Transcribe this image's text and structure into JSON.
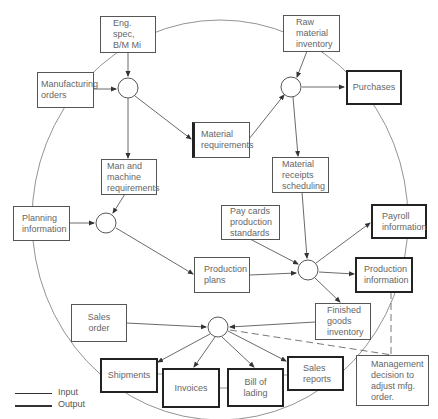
{
  "diagram": {
    "nodes": {
      "eng_spec": "Eng. spec,\nB/M Mi",
      "raw_material": "Raw\nmaterial\ninventory",
      "manufacturing_orders": "Manufacturing\norders",
      "purchases": "Purchases",
      "material_requirements": "Material\nrequirements",
      "man_machine": "Man and\nmachine\nrequirements",
      "material_receipts": "Material\nreceipts\nscheduling",
      "planning_information": "Planning\ninformation",
      "pay_cards": "Pay cards\nproduction\nstandards",
      "payroll_information": "Payroll\ninformation",
      "production_plans": "Production\nplans",
      "production_information": "Production\ninformation",
      "sales_order": "Sales\norder",
      "finished_goods": "Finished\ngoods\ninventory",
      "shipments": "Shipments",
      "invoices": "Invoices",
      "bill_of_lading": "Bill of\nlading",
      "sales_reports": "Sales\nreports",
      "management_decision": "Management\ndecision to\nadjust mfg.\norder."
    },
    "legend": {
      "input": "Input",
      "output": "Output"
    }
  }
}
